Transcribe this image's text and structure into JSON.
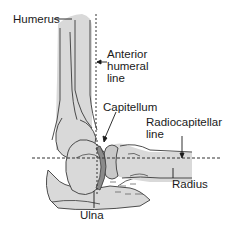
{
  "diagram": {
    "type": "anatomical-illustration",
    "colors": {
      "bone_fill": "#d9d9d9",
      "outline": "#3a3a3a",
      "capitellum_ring": "#8a8a8a",
      "reference_line": "#333333",
      "text": "#1a1a1a"
    },
    "labels": {
      "humerus": "Humerus",
      "anterior_humeral_line_1": "Anterior",
      "anterior_humeral_line_2": "humeral",
      "anterior_humeral_line_3": "line",
      "capitellum": "Capitellum",
      "radiocapitellar_line_1": "Radiocapitellar",
      "radiocapitellar_line_2": "line",
      "radius": "Radius",
      "ulna": "Ulna"
    },
    "reference_lines": [
      {
        "name": "Anterior humeral line",
        "orientation": "vertical",
        "style": "dashed"
      },
      {
        "name": "Radiocapitellar line",
        "orientation": "horizontal",
        "style": "dashed"
      }
    ]
  }
}
